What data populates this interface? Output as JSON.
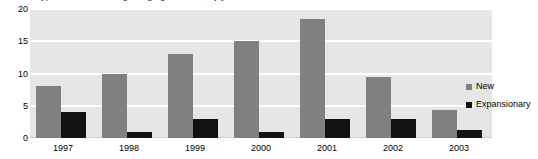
{
  "chart_data": {
    "type": "bar",
    "title": "Type of collective bargaining agreements, by year",
    "xlabel": "",
    "ylabel": "",
    "categories": [
      "1997",
      "1998",
      "1999",
      "2000",
      "2001",
      "2002",
      "2003"
    ],
    "series": [
      {
        "name": "New",
        "color": "#808080",
        "values": [
          8,
          10,
          13,
          15,
          18.5,
          9.5,
          4.3
        ]
      },
      {
        "name": "Expansionary",
        "color": "#121212",
        "values": [
          4,
          1,
          3,
          1,
          3,
          3,
          1.3
        ]
      }
    ],
    "ylim": [
      0,
      20
    ],
    "yticks": [
      0,
      5,
      10,
      15,
      20
    ],
    "grid": true,
    "legend_position": "right"
  },
  "legend": {
    "entries": [
      {
        "label": "New"
      },
      {
        "label": "Expansionary"
      }
    ]
  }
}
